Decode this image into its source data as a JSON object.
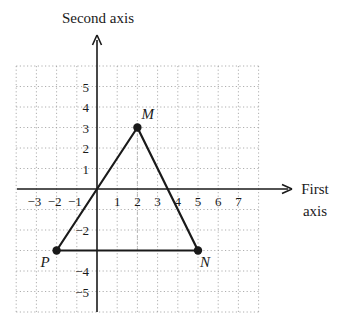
{
  "diagram": {
    "type": "coordinate-plane",
    "y_axis_title": "Second axis",
    "x_axis_title_line1": "First",
    "x_axis_title_line2": "axis",
    "grid": {
      "x_min": -4,
      "x_max": 8,
      "y_min": -6,
      "y_max": 6,
      "style": "dotted"
    },
    "x_tick_labels": [
      {
        "value": -3,
        "text": "−3"
      },
      {
        "value": -2,
        "text": "−2"
      },
      {
        "value": -1,
        "text": "−1"
      },
      {
        "value": 1,
        "text": "1"
      },
      {
        "value": 2,
        "text": "2"
      },
      {
        "value": 3,
        "text": "3"
      },
      {
        "value": 4,
        "text": "4"
      },
      {
        "value": 5,
        "text": "5"
      },
      {
        "value": 6,
        "text": "6"
      },
      {
        "value": 7,
        "text": "7"
      }
    ],
    "y_tick_labels": [
      {
        "value": 5,
        "text": "5"
      },
      {
        "value": 4,
        "text": "4"
      },
      {
        "value": 3,
        "text": "3"
      },
      {
        "value": 2,
        "text": "2"
      },
      {
        "value": 1,
        "text": "1"
      },
      {
        "value": -2,
        "text": "−2"
      },
      {
        "value": -4,
        "text": "−4"
      },
      {
        "value": -5,
        "text": "−5"
      }
    ],
    "points": [
      {
        "name": "M",
        "x": 2,
        "y": 3
      },
      {
        "name": "N",
        "x": 5,
        "y": -3
      },
      {
        "name": "P",
        "x": -2,
        "y": -3
      }
    ],
    "segments": [
      [
        "P",
        "M"
      ],
      [
        "M",
        "N"
      ],
      [
        "P",
        "N"
      ]
    ],
    "point_labels": {
      "M": "M",
      "N": "N",
      "P": "P"
    },
    "colors": {
      "line": "#1a1a1a",
      "grid": "#9a9a9a",
      "background": "#ffffff"
    }
  }
}
